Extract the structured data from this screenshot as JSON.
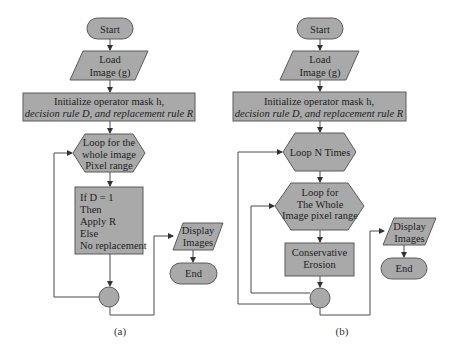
{
  "diagram_a": {
    "start": "Start",
    "load": [
      "Load",
      "Image (g)"
    ],
    "init": [
      "Initialize operator mask h,",
      "decision rule D, and replacement rule R"
    ],
    "loop": [
      "Loop for the",
      "whole image",
      "Pixel range"
    ],
    "process": [
      "If D = 1",
      "Then",
      "Apply R",
      "Else",
      "No replacement"
    ],
    "display": [
      "Display",
      "Images"
    ],
    "end": "End",
    "caption": "(a)"
  },
  "diagram_b": {
    "start": "Start",
    "load": [
      "Load",
      "Image (g)"
    ],
    "init": [
      "Initialize operator mask h,",
      "decision rule D, and replacement rule R"
    ],
    "loop_n": "Loop N Times",
    "loop_whole": [
      "Loop for",
      "The Whole",
      "Image pixel range"
    ],
    "process": [
      "Conservative",
      "Erosion"
    ],
    "display": [
      "Display",
      "Images"
    ],
    "end": "End",
    "caption": "(b)"
  },
  "colors": {
    "shape_fill": "#a9a9a9",
    "shape_stroke": "#5a5a5a",
    "line": "#4a4a4a",
    "text": "#1e1e1e"
  }
}
